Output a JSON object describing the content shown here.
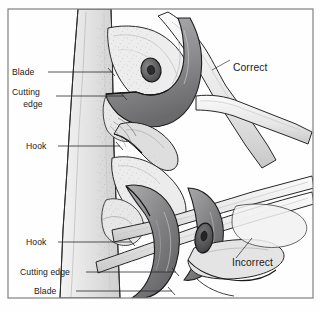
{
  "figure": {
    "frame_color": "#7a7a7a",
    "line_color": "#1a1a1a",
    "background": "#fefefe"
  },
  "panels": [
    {
      "id": "upper",
      "verdict": "Correct"
    },
    {
      "id": "lower",
      "verdict": "Incorrect"
    }
  ],
  "labels": {
    "upper": {
      "blade": "Blade",
      "cutting_edge_line1": "Cutting",
      "cutting_edge_line2": "edge",
      "hook": "Hook"
    },
    "lower": {
      "hook": "Hook",
      "cutting_edge": "Cutting edge",
      "blade": "Blade"
    },
    "verdicts": {
      "correct": "Correct",
      "incorrect": "Incorrect"
    }
  },
  "palette": {
    "outline": "#1d1d1d",
    "blade_dark": "#6f6f70",
    "blade_mid": "#9a9a9c",
    "metal_light": "#c9c9cb",
    "wood_light": "#efefef",
    "wood_mid": "#d7d7d7",
    "pivot": "#58585a",
    "frame": "#808080"
  }
}
